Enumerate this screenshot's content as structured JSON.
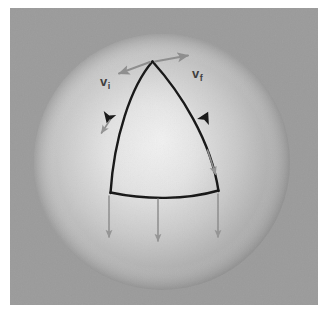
{
  "figure": {
    "background_color": "#ffffff",
    "panel_color": "#9b9b9b",
    "sphere_light_color": "#e9e9e9",
    "sphere_mid_color": "#c4c4c4",
    "sphere_shadow_color": "#8e8e8e",
    "path_color": "#141414",
    "vector_color": "#8f8f8f"
  },
  "panel": {
    "x": 10,
    "y": 8,
    "width": 308,
    "height": 297
  },
  "sphere": {
    "center_x": 162,
    "center_y": 162,
    "radius": 128
  },
  "triangle": {
    "apex": {
      "x": 152,
      "y": 61
    },
    "bottom_left": {
      "x": 110,
      "y": 192
    },
    "bottom_right": {
      "x": 218,
      "y": 190
    },
    "edges": [
      {
        "name": "left-edge",
        "from": "apex",
        "to": "bottom_left"
      },
      {
        "name": "right-edge",
        "from": "bottom_right",
        "to": "apex"
      },
      {
        "name": "bottom-edge",
        "from": "bottom_left",
        "to": "bottom_right"
      }
    ]
  },
  "labels": {
    "v_initial": {
      "symbol": "v",
      "subscript": "i",
      "x": 100,
      "y": 86
    },
    "v_final": {
      "symbol": "v",
      "subscript": "f",
      "x": 192,
      "y": 78
    }
  },
  "vectors": [
    {
      "name": "vector-initial-apex",
      "x1": 150,
      "y1": 62,
      "x2": 118,
      "y2": 74
    },
    {
      "name": "vector-final-apex",
      "x1": 155,
      "y1": 61,
      "x2": 189,
      "y2": 55
    },
    {
      "name": "vector-left-edge",
      "x1": 110,
      "y1": 120,
      "x2": 101,
      "y2": 134
    },
    {
      "name": "vector-right-edge",
      "x1": 208,
      "y1": 150,
      "x2": 216,
      "y2": 175
    },
    {
      "name": "vector-bottom-left",
      "x1": 109,
      "y1": 196,
      "x2": 109,
      "y2": 238
    },
    {
      "name": "vector-bottom-middle",
      "x1": 158,
      "y1": 199,
      "x2": 158,
      "y2": 242
    },
    {
      "name": "vector-bottom-right",
      "x1": 218,
      "y1": 194,
      "x2": 218,
      "y2": 238
    }
  ],
  "direction_arrowheads": [
    {
      "name": "arrowhead-left-edge-down",
      "x": 110,
      "y": 113,
      "rotation": 108
    },
    {
      "name": "arrowhead-right-edge-up",
      "x": 203,
      "y": 122,
      "rotation": -64
    }
  ]
}
